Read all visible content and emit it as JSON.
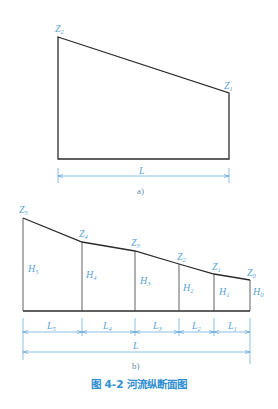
{
  "figure_a": {
    "labels": {
      "z2": "Z",
      "z2_sub": "2",
      "z1": "Z",
      "z1_sub": "1",
      "length": "L"
    },
    "sublabel": "a)"
  },
  "figure_b": {
    "z_labels": [
      {
        "main": "Z",
        "sub": "5"
      },
      {
        "main": "Z",
        "sub": "4"
      },
      {
        "main": "Z",
        "sub": "3"
      },
      {
        "main": "Z",
        "sub": "2"
      },
      {
        "main": "Z",
        "sub": "1"
      },
      {
        "main": "Z",
        "sub": "0"
      }
    ],
    "h_labels": [
      {
        "main": "H",
        "sub": "5"
      },
      {
        "main": "H",
        "sub": "4"
      },
      {
        "main": "H",
        "sub": "3"
      },
      {
        "main": "H",
        "sub": "2"
      },
      {
        "main": "H",
        "sub": "1"
      },
      {
        "main": "H",
        "sub": "0"
      }
    ],
    "l_labels": [
      {
        "main": "L",
        "sub": "5"
      },
      {
        "main": "L",
        "sub": "4"
      },
      {
        "main": "L",
        "sub": "3"
      },
      {
        "main": "L",
        "sub": "2"
      },
      {
        "main": "L",
        "sub": "1"
      }
    ],
    "total_length": "L",
    "sublabel": "b)"
  },
  "caption": "图 4-2   河流纵断面图",
  "colors": {
    "annotation": "#5ba3d6",
    "caption": "#2f8fd1",
    "outline": "#2b2b2b"
  }
}
